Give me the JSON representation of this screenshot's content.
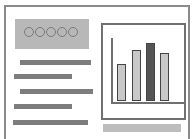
{
  "hero": {
    "dots": 5,
    "fill": "#b8b8b8"
  },
  "text_lines": [
    {
      "left": 20,
      "top": 60,
      "width": 71
    },
    {
      "left": 14,
      "top": 74,
      "width": 58
    },
    {
      "left": 20,
      "top": 89,
      "width": 73
    },
    {
      "left": 14,
      "top": 104,
      "width": 58
    },
    {
      "left": 13,
      "top": 120,
      "width": 75
    }
  ],
  "chart_data": {
    "type": "bar",
    "title": "",
    "xlabel": "",
    "ylabel": "",
    "categories": [
      "1",
      "2",
      "3",
      "4"
    ],
    "values": [
      37,
      51,
      58,
      48
    ],
    "ylim": [
      0,
      65
    ],
    "highlight_index": 2,
    "colors": {
      "bar": "#c8c8c8",
      "highlight": "#555555",
      "outline": "#444444"
    },
    "grid": false,
    "legend": null
  },
  "footer_bar": {
    "fill": "#bdbdbd"
  }
}
